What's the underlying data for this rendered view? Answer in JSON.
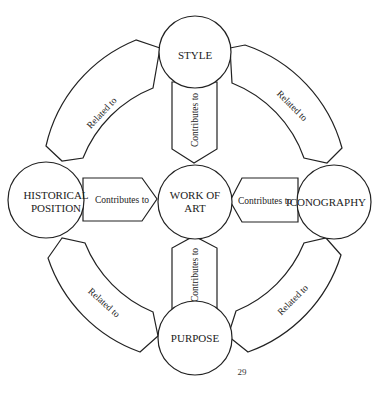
{
  "nodes": {
    "style": {
      "label": "STYLE"
    },
    "work_of_art": {
      "line1": "WORK OF",
      "line2": "ART"
    },
    "historical_position": {
      "line1": "HISTORICAL",
      "line2": "POSITION"
    },
    "iconography": {
      "label": "ICONOGRAPHY"
    },
    "purpose": {
      "label": "PURPOSE"
    }
  },
  "edges": {
    "style_to_work": "Contributes to",
    "historical_to_work": "Contributes to",
    "iconography_to_work": "Contributes to",
    "purpose_to_work": "Contributes to",
    "style_historical": "Related to",
    "style_iconography": "Related to",
    "historical_purpose": "Related to",
    "iconography_purpose": "Related to"
  },
  "page_number": "29",
  "colors": {
    "stroke": "#222222",
    "fill": "#ffffff"
  }
}
